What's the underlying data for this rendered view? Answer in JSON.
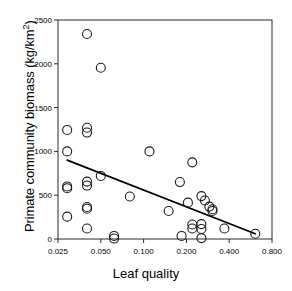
{
  "chart_data": {
    "type": "scatter",
    "title": "",
    "xlabel": "Leaf quality",
    "ylabel_text": "Primate community biomass (kg/km",
    "ylabel_sup": "2",
    "ylabel_tail": ")",
    "ylabel_full": "Primate community biomass (kg/km2)",
    "xscale": "log",
    "yscale": "linear",
    "xlim": [
      0.025,
      0.8
    ],
    "ylim": [
      0,
      2500
    ],
    "xticks": [
      0.025,
      0.05,
      0.1,
      0.2,
      0.4,
      0.8
    ],
    "xticklabels": [
      "0.025",
      "0.050",
      "0.100",
      "0.200",
      "0.400",
      "0.800"
    ],
    "yticks": [
      0,
      500,
      1000,
      1500,
      2000,
      2500
    ],
    "yticklabels": [
      "0",
      "500",
      "1000",
      "1500",
      "2000",
      "2500"
    ],
    "grid": false,
    "legend": null,
    "marker": {
      "shape": "circle",
      "facecolor": "none",
      "edgecolor": "#1a1a1a",
      "size": 9
    },
    "points": [
      {
        "x": 0.04,
        "y": 2340
      },
      {
        "x": 0.05,
        "y": 1955
      },
      {
        "x": 0.029,
        "y": 1245
      },
      {
        "x": 0.04,
        "y": 1270
      },
      {
        "x": 0.04,
        "y": 1215
      },
      {
        "x": 0.029,
        "y": 1000
      },
      {
        "x": 0.11,
        "y": 1000
      },
      {
        "x": 0.22,
        "y": 875
      },
      {
        "x": 0.05,
        "y": 720
      },
      {
        "x": 0.04,
        "y": 655
      },
      {
        "x": 0.04,
        "y": 610
      },
      {
        "x": 0.029,
        "y": 600
      },
      {
        "x": 0.029,
        "y": 580
      },
      {
        "x": 0.18,
        "y": 650
      },
      {
        "x": 0.08,
        "y": 485
      },
      {
        "x": 0.255,
        "y": 490
      },
      {
        "x": 0.27,
        "y": 440
      },
      {
        "x": 0.205,
        "y": 415
      },
      {
        "x": 0.29,
        "y": 370
      },
      {
        "x": 0.305,
        "y": 340
      },
      {
        "x": 0.305,
        "y": 320
      },
      {
        "x": 0.04,
        "y": 365
      },
      {
        "x": 0.04,
        "y": 345
      },
      {
        "x": 0.15,
        "y": 320
      },
      {
        "x": 0.029,
        "y": 255
      },
      {
        "x": 0.22,
        "y": 165
      },
      {
        "x": 0.255,
        "y": 170
      },
      {
        "x": 0.22,
        "y": 120
      },
      {
        "x": 0.255,
        "y": 115
      },
      {
        "x": 0.37,
        "y": 120
      },
      {
        "x": 0.04,
        "y": 120
      },
      {
        "x": 0.185,
        "y": 35
      },
      {
        "x": 0.255,
        "y": 10
      },
      {
        "x": 0.062,
        "y": 35
      },
      {
        "x": 0.062,
        "y": 5
      },
      {
        "x": 0.61,
        "y": 60
      }
    ],
    "trendline": {
      "type": "linear-fit",
      "x_start": 0.029,
      "y_start": 900,
      "x_end": 0.61,
      "y_end": 60,
      "color": "#000000",
      "width": 1.8
    }
  }
}
